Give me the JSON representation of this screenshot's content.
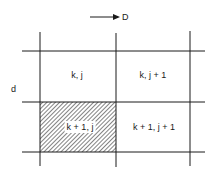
{
  "diagram": {
    "arrow_label": "D",
    "axis_label": "d",
    "cells": [
      {
        "label": "k, j",
        "row": 0,
        "col": 0,
        "hatched": false
      },
      {
        "label": "k, j + 1",
        "row": 0,
        "col": 1,
        "hatched": false
      },
      {
        "label": "k + 1, j",
        "row": 1,
        "col": 0,
        "hatched": true
      },
      {
        "label": "k + 1, j + 1",
        "row": 1,
        "col": 1,
        "hatched": false
      }
    ],
    "colors": {
      "line": "#1a1a1a",
      "background": "#ffffff"
    }
  }
}
